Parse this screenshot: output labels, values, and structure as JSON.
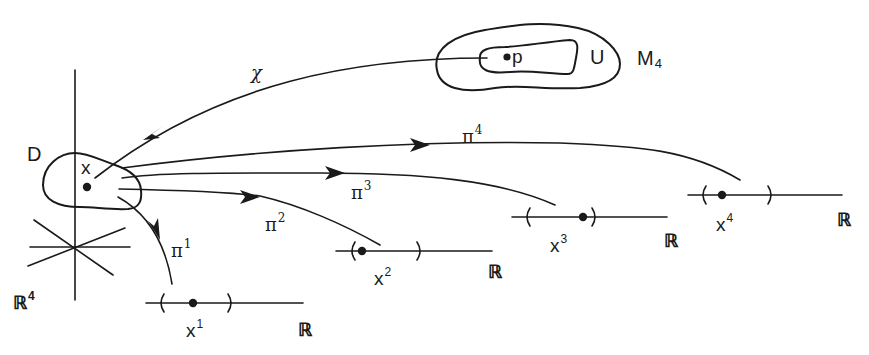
{
  "figure": {
    "manifold": {
      "name": "M",
      "index": "4",
      "open_set": "U",
      "point": "p"
    },
    "chart": {
      "symbol": "χ"
    },
    "domain": {
      "name": "D",
      "point": "x"
    },
    "space": {
      "name": "ℝ",
      "power": "4"
    },
    "projections": [
      {
        "symbol": "π",
        "index": "1",
        "target": "ℝ",
        "coord": "x",
        "coord_index": "1"
      },
      {
        "symbol": "π",
        "index": "2",
        "target": "ℝ",
        "coord": "x",
        "coord_index": "2"
      },
      {
        "symbol": "π",
        "index": "3",
        "target": "ℝ",
        "coord": "x",
        "coord_index": "3"
      },
      {
        "symbol": "π",
        "index": "4",
        "target": "ℝ",
        "coord": "x",
        "coord_index": "4"
      }
    ],
    "colors": {
      "ink": "#1a1a1a",
      "background": "#ffffff"
    }
  }
}
